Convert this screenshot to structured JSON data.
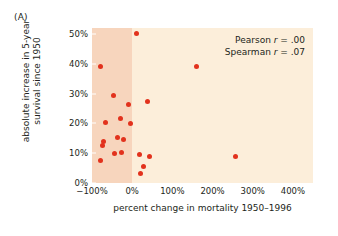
{
  "panel": {
    "label": "(A)"
  },
  "axes": {
    "x_title": "percent change in mortality 1950–1996",
    "y_title_line1": "absolute increase in 5-year",
    "y_title_line2": "survival since 1950"
  },
  "annotations": {
    "pearson_label": "Pearson ",
    "pearson_r": "r",
    "pearson_value": " = .00",
    "spearman_label": "Spearman ",
    "spearman_r": "r",
    "spearman_value": " = .07"
  },
  "colors": {
    "dot": "#e2321d",
    "plot_background": "#fceeda",
    "shade_band": "#f7d5bd",
    "text": "#231f20"
  },
  "chart_data": {
    "type": "scatter",
    "title": "(A)",
    "xlabel": "percent change in mortality 1950–1996",
    "ylabel": "absolute increase in 5-year survival since 1950",
    "xlim": [
      -100,
      450
    ],
    "ylim": [
      0,
      52
    ],
    "xticks": [
      -100,
      0,
      100,
      200,
      300,
      400
    ],
    "xtick_labels": [
      "−100%",
      "0%",
      "100%",
      "200%",
      "300%",
      "400%"
    ],
    "yticks": [
      0,
      10,
      20,
      30,
      40,
      50
    ],
    "ytick_labels": [
      "0%",
      "10%",
      "20%",
      "30%",
      "40%",
      "50%"
    ],
    "grid": false,
    "legend": "none",
    "shaded_region": {
      "x_from": -100,
      "x_to": 0,
      "note": "darker band over negative mortality change"
    },
    "annotations": [
      "Pearson r = .00",
      "Spearman r = .07"
    ],
    "points": [
      {
        "x": 10,
        "y": 50.3
      },
      {
        "x": -78,
        "y": 39.0
      },
      {
        "x": 160,
        "y": 39.2
      },
      {
        "x": -47,
        "y": 29.3
      },
      {
        "x": 38,
        "y": 27.4
      },
      {
        "x": -8,
        "y": 26.4
      },
      {
        "x": -29,
        "y": 21.5
      },
      {
        "x": -67,
        "y": 20.3
      },
      {
        "x": -5,
        "y": 20.1
      },
      {
        "x": -37,
        "y": 15.4
      },
      {
        "x": -72,
        "y": 13.8
      },
      {
        "x": -22,
        "y": 14.6
      },
      {
        "x": -75,
        "y": 12.5
      },
      {
        "x": -44,
        "y": 9.8
      },
      {
        "x": -26,
        "y": 10.3
      },
      {
        "x": 18,
        "y": 9.7
      },
      {
        "x": 42,
        "y": 8.9
      },
      {
        "x": 258,
        "y": 8.8
      },
      {
        "x": -80,
        "y": 7.4
      },
      {
        "x": 28,
        "y": 5.4
      },
      {
        "x": 20,
        "y": 3.1
      }
    ]
  }
}
